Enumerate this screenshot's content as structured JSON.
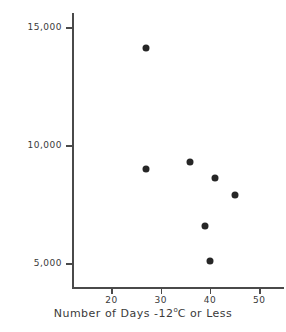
{
  "chart_data": {
    "type": "scatter",
    "title": "",
    "xlabel_prefix": "Number of Days -12",
    "xlabel_sup": "o",
    "xlabel_suffix": "C or Less",
    "xlabel": "Number of Days -12°C or Less",
    "ylabel": "Number of Adults Returning",
    "xlim": [
      12,
      55
    ],
    "ylim": [
      4000,
      15600
    ],
    "grid": false,
    "legend": null,
    "xticks": [
      20,
      30,
      40,
      50
    ],
    "xtick_labels": [
      "20",
      "30",
      "40",
      "50"
    ],
    "yticks": [
      5000,
      10000,
      15000
    ],
    "ytick_labels": [
      "5,000",
      "10,000",
      "15,000"
    ],
    "marker_color": "#262626",
    "axis_color": "#4a4a4a",
    "points": [
      {
        "x": 27,
        "y": 14100
      },
      {
        "x": 27,
        "y": 9000
      },
      {
        "x": 36,
        "y": 9300
      },
      {
        "x": 41,
        "y": 8600
      },
      {
        "x": 45,
        "y": 7900
      },
      {
        "x": 39,
        "y": 6600
      },
      {
        "x": 40,
        "y": 5100
      }
    ]
  }
}
